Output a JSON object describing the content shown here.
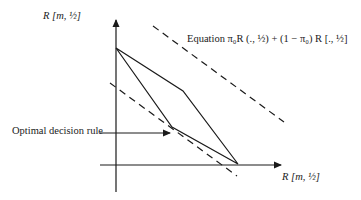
{
  "diagram": {
    "y_axis_label": "R [m, ½]",
    "x_axis_label": "R [m, ½]",
    "equation_label": "Equation π₀R (., ½) + (1 − π₀) R [., ½]",
    "optimal_label": "Optimal decision rule",
    "colors": {
      "ink": "#1a1a1a",
      "background": "#ffffff"
    }
  }
}
